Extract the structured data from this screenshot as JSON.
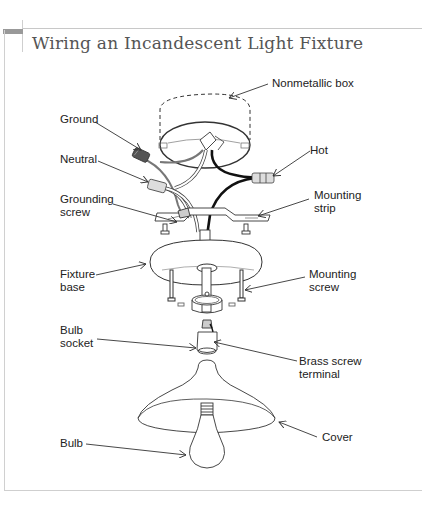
{
  "title": "Wiring an Incandescent Light Fixture",
  "labels": {
    "nonmetallic_box": "Nonmetallic box",
    "ground": "Ground",
    "neutral": "Neutral",
    "grounding_screw_1": "Grounding",
    "grounding_screw_2": "screw",
    "hot": "Hot",
    "mounting_strip_1": "Mounting",
    "mounting_strip_2": "strip",
    "fixture_base_1": "Fixture",
    "fixture_base_2": "base",
    "mounting_screw_1": "Mounting",
    "mounting_screw_2": "screw",
    "bulb_socket_1": "Bulb",
    "bulb_socket_2": "socket",
    "brass_screw_terminal_1": "Brass screw",
    "brass_screw_terminal_2": "terminal",
    "cover": "Cover",
    "bulb": "Bulb"
  },
  "colors": {
    "title": "#555555",
    "frame": "#c8c8c8",
    "tab": "#999999",
    "hot_wire": "#1a1a1a",
    "ground_wire": "#888888",
    "neutral_wire": "#ffffff"
  }
}
